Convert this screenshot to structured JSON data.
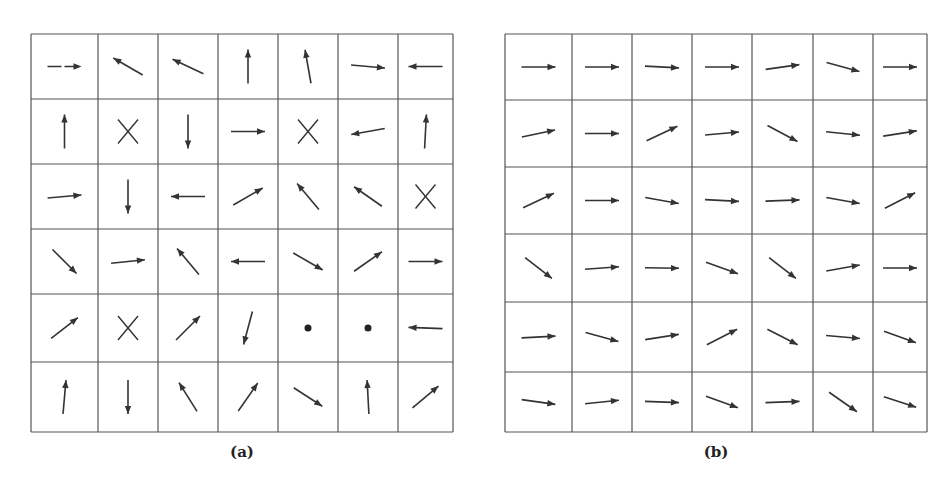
{
  "panels": [
    {
      "id": "a",
      "caption": "(a)",
      "x": 31,
      "y": 34,
      "w": 422,
      "h": 398,
      "cols": [
        31,
        98,
        158,
        218,
        278,
        338,
        398,
        453
      ],
      "rows": [
        34,
        99,
        164,
        229,
        294,
        362,
        432
      ],
      "cells": [
        [
          {
            "t": "arrow",
            "a": 0,
            "dash": true
          },
          {
            "t": "arrow",
            "a": -150
          },
          {
            "t": "arrow",
            "a": -155,
            "rev": true
          },
          {
            "t": "arrow",
            "a": -90
          },
          {
            "t": "arrow",
            "a": -100
          },
          {
            "t": "arrow",
            "a": 5
          },
          {
            "t": "arrow",
            "a": 180
          }
        ],
        [
          {
            "t": "arrow",
            "a": -90
          },
          {
            "t": "x"
          },
          {
            "t": "arrow",
            "a": 90
          },
          {
            "t": "arrow",
            "a": 0
          },
          {
            "t": "x"
          },
          {
            "t": "arrow",
            "a": 170
          },
          {
            "t": "arrow",
            "a": -87
          }
        ],
        [
          {
            "t": "arrow",
            "a": -5
          },
          {
            "t": "arrow",
            "a": 90
          },
          {
            "t": "arrow",
            "a": 180
          },
          {
            "t": "arrow",
            "a": -30
          },
          {
            "t": "arrow",
            "a": -130
          },
          {
            "t": "arrow",
            "a": -145
          },
          {
            "t": "x"
          }
        ],
        [
          {
            "t": "arrow",
            "a": 45
          },
          {
            "t": "arrow",
            "a": -6
          },
          {
            "t": "arrow",
            "a": -130
          },
          {
            "t": "arrow",
            "a": 180
          },
          {
            "t": "arrow",
            "a": 30
          },
          {
            "t": "arrow",
            "a": -35
          },
          {
            "t": "arrow",
            "a": 0
          }
        ],
        [
          {
            "t": "arrow",
            "a": -38
          },
          {
            "t": "x"
          },
          {
            "t": "arrow",
            "a": -45
          },
          {
            "t": "arrow",
            "a": 105
          },
          {
            "t": "dot"
          },
          {
            "t": "dot"
          },
          {
            "t": "arrow",
            "a": 182
          }
        ],
        [
          {
            "t": "arrow",
            "a": -85
          },
          {
            "t": "arrow",
            "a": 90
          },
          {
            "t": "arrow",
            "a": -122
          },
          {
            "t": "arrow",
            "a": -55
          },
          {
            "t": "arrow",
            "a": 33
          },
          {
            "t": "arrow",
            "a": -93
          },
          {
            "t": "arrow",
            "a": -40
          }
        ]
      ]
    },
    {
      "id": "b",
      "caption": "(b)",
      "x": 505,
      "y": 34,
      "w": 422,
      "h": 398,
      "cols": [
        505,
        572,
        632,
        692,
        752,
        813,
        873,
        927
      ],
      "rows": [
        34,
        100,
        167,
        234,
        302,
        372,
        432
      ],
      "cells": [
        [
          {
            "t": "arrow",
            "a": 0
          },
          {
            "t": "arrow",
            "a": 0
          },
          {
            "t": "arrow",
            "a": 3
          },
          {
            "t": "arrow",
            "a": 0
          },
          {
            "t": "arrow",
            "a": -8
          },
          {
            "t": "arrow",
            "a": 15
          },
          {
            "t": "arrow",
            "a": 0
          }
        ],
        [
          {
            "t": "arrow",
            "a": -12
          },
          {
            "t": "arrow",
            "a": 0
          },
          {
            "t": "arrow",
            "a": -25
          },
          {
            "t": "arrow",
            "a": -5
          },
          {
            "t": "arrow",
            "a": 28
          },
          {
            "t": "arrow",
            "a": 6
          },
          {
            "t": "arrow",
            "a": -9
          }
        ],
        [
          {
            "t": "arrow",
            "a": -25
          },
          {
            "t": "arrow",
            "a": 0
          },
          {
            "t": "arrow",
            "a": 10
          },
          {
            "t": "arrow",
            "a": 3
          },
          {
            "t": "arrow",
            "a": -2
          },
          {
            "t": "arrow",
            "a": 10
          },
          {
            "t": "arrow",
            "a": -27
          }
        ],
        [
          {
            "t": "arrow",
            "a": 38
          },
          {
            "t": "arrow",
            "a": -4
          },
          {
            "t": "arrow",
            "a": 1
          },
          {
            "t": "arrow",
            "a": 20
          },
          {
            "t": "arrow",
            "a": 38
          },
          {
            "t": "arrow",
            "a": -10
          },
          {
            "t": "arrow",
            "a": 0
          }
        ],
        [
          {
            "t": "arrow",
            "a": -3
          },
          {
            "t": "arrow",
            "a": 15
          },
          {
            "t": "arrow",
            "a": -9
          },
          {
            "t": "arrow",
            "a": -27
          },
          {
            "t": "arrow",
            "a": 27
          },
          {
            "t": "arrow",
            "a": 5
          },
          {
            "t": "arrow",
            "a": 20
          }
        ],
        [
          {
            "t": "arrow",
            "a": 8
          },
          {
            "t": "arrow",
            "a": -6
          },
          {
            "t": "arrow",
            "a": 2
          },
          {
            "t": "arrow",
            "a": 20
          },
          {
            "t": "arrow",
            "a": -2
          },
          {
            "t": "arrow",
            "a": 35
          },
          {
            "t": "arrow",
            "a": 18
          }
        ]
      ]
    }
  ],
  "style": {
    "line": "#555555",
    "arrow": "#333333"
  }
}
